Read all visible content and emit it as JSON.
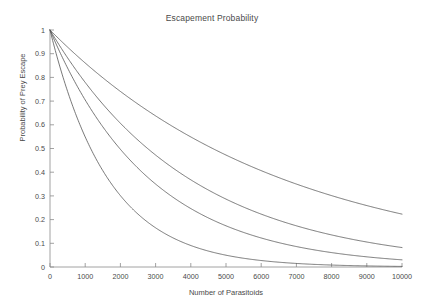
{
  "chart_data": {
    "type": "line",
    "title": "Escapement Probability",
    "xlabel": "Number of Parasitoids",
    "ylabel": "Probability of Prey Escape",
    "xlim": [
      0,
      10000
    ],
    "ylim": [
      0,
      1
    ],
    "xticks": [
      0,
      1000,
      2000,
      3000,
      4000,
      5000,
      6000,
      7000,
      8000,
      9000,
      10000
    ],
    "xticklabels": [
      "0",
      "1000",
      "2000",
      "3000",
      "4000",
      "5000",
      "6000",
      "7000",
      "8000",
      "9000",
      "10000"
    ],
    "yticks": [
      0,
      0.1,
      0.2,
      0.3,
      0.4,
      0.5,
      0.6,
      0.7,
      0.8,
      0.9,
      1
    ],
    "yticklabels": [
      "0",
      "0.1",
      "0.2",
      "0.3",
      "0.4",
      "0.5",
      "0.6",
      "0.7",
      "0.8",
      "0.9",
      "1"
    ],
    "grid": false,
    "legend": false,
    "line_color": "#555555",
    "x": [
      0,
      250,
      500,
      750,
      1000,
      1250,
      1500,
      1750,
      2000,
      2250,
      2500,
      2750,
      3000,
      3250,
      3500,
      3750,
      4000,
      4250,
      4500,
      4750,
      5000,
      5250,
      5500,
      5750,
      6000,
      6250,
      6500,
      6750,
      7000,
      7250,
      7500,
      7750,
      8000,
      8250,
      8500,
      8750,
      9000,
      9250,
      9500,
      9750,
      10000
    ],
    "series": [
      {
        "name": "curve-1",
        "decay_rate": 0.00015,
        "values": [
          1,
          0.963,
          0.928,
          0.894,
          0.861,
          0.829,
          0.799,
          0.769,
          0.741,
          0.713,
          0.687,
          0.662,
          0.638,
          0.614,
          0.591,
          0.57,
          0.549,
          0.528,
          0.509,
          0.49,
          0.472,
          0.455,
          0.438,
          0.422,
          0.407,
          0.392,
          0.377,
          0.363,
          0.35,
          0.337,
          0.325,
          0.313,
          0.301,
          0.29,
          0.279,
          0.269,
          0.259,
          0.25,
          0.241,
          0.232,
          0.223
        ]
      },
      {
        "name": "curve-2",
        "decay_rate": 0.00025,
        "values": [
          1,
          0.939,
          0.882,
          0.829,
          0.779,
          0.732,
          0.687,
          0.646,
          0.607,
          0.57,
          0.535,
          0.503,
          0.472,
          0.444,
          0.417,
          0.392,
          0.368,
          0.346,
          0.325,
          0.305,
          0.287,
          0.269,
          0.253,
          0.238,
          0.223,
          0.21,
          0.197,
          0.185,
          0.174,
          0.163,
          0.153,
          0.144,
          0.135,
          0.127,
          0.119,
          0.112,
          0.105,
          0.099,
          0.093,
          0.087,
          0.082
        ]
      },
      {
        "name": "curve-3",
        "decay_rate": 0.00035,
        "values": [
          1,
          0.916,
          0.839,
          0.769,
          0.705,
          0.646,
          0.592,
          0.542,
          0.497,
          0.455,
          0.417,
          0.382,
          0.35,
          0.321,
          0.294,
          0.269,
          0.247,
          0.226,
          0.207,
          0.19,
          0.174,
          0.159,
          0.146,
          0.134,
          0.122,
          0.112,
          0.103,
          0.094,
          0.086,
          0.079,
          0.072,
          0.066,
          0.061,
          0.056,
          0.051,
          0.047,
          0.043,
          0.039,
          0.036,
          0.033,
          0.03
        ]
      },
      {
        "name": "curve-4",
        "decay_rate": 0.0006,
        "values": [
          1,
          0.861,
          0.741,
          0.638,
          0.549,
          0.472,
          0.407,
          0.35,
          0.301,
          0.259,
          0.223,
          0.192,
          0.165,
          0.142,
          0.122,
          0.105,
          0.091,
          0.078,
          0.067,
          0.058,
          0.05,
          0.043,
          0.037,
          0.032,
          0.027,
          0.024,
          0.02,
          0.017,
          0.015,
          0.013,
          0.011,
          0.0096,
          0.0082,
          0.0071,
          0.0061,
          0.0053,
          0.0045,
          0.0039,
          0.0034,
          0.0029,
          0.0025
        ]
      }
    ]
  }
}
